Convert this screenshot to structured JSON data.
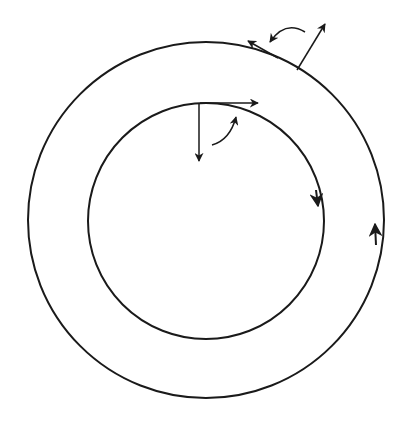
{
  "diagram": {
    "colors": {
      "stroke": "#1a1a1a",
      "background": "#ffffff"
    },
    "outer_circle": {
      "cx": 206,
      "cy": 220,
      "r": 178,
      "direction": "counter-clockwise",
      "arrow_at": "right side"
    },
    "inner_circle": {
      "cx": 206,
      "cy": 221,
      "r": 118,
      "direction": "clockwise",
      "arrow_at": "right side"
    },
    "inner_vectors": [
      "tangent-right",
      "radial-down",
      "curved-rotation-arrow"
    ],
    "outer_vectors": [
      "tangent-up-left",
      "radial-outward",
      "curved-rotation-arrow"
    ]
  }
}
